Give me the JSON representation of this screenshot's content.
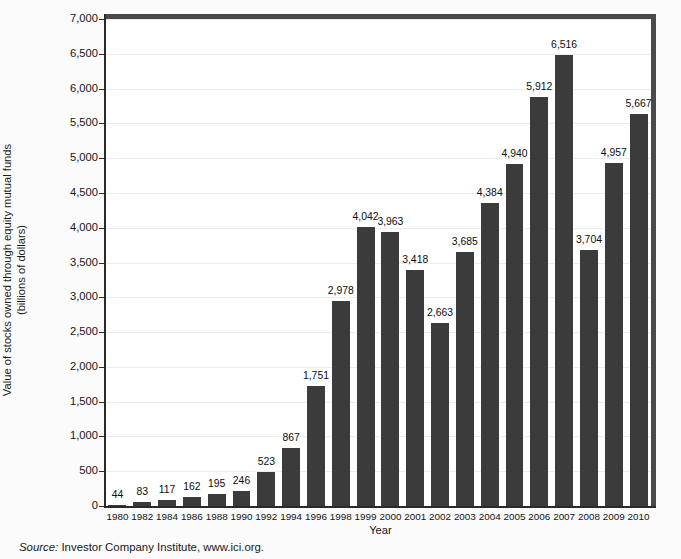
{
  "chart_data": {
    "type": "bar",
    "title": "",
    "xlabel": "Year",
    "ylabel": "Value of stocks owned through equity mutual funds",
    "ylabel_line2": "(billions of dollars)",
    "ylim": [
      0,
      7000
    ],
    "ytick_step": 500,
    "ytick_labels": [
      "7,000",
      "6,500",
      "6,000",
      "5,500",
      "5,000",
      "4,500",
      "4,000",
      "3,500",
      "3,000",
      "2,500",
      "2,000",
      "1,500",
      "1,000",
      "500",
      "0"
    ],
    "ytick_values": [
      7000,
      6500,
      6000,
      5500,
      5000,
      4500,
      4000,
      3500,
      3000,
      2500,
      2000,
      1500,
      1000,
      500,
      0
    ],
    "grid": true,
    "legend": "none",
    "bar_color": "#3b3b3b",
    "categories": [
      "1980",
      "1982",
      "1984",
      "1986",
      "1988",
      "1990",
      "1992",
      "1994",
      "1996",
      "1998",
      "1999",
      "2000",
      "2001",
      "2002",
      "2003",
      "2004",
      "2005",
      "2006",
      "2007",
      "2008",
      "2009",
      "2010"
    ],
    "values": [
      44,
      83,
      117,
      162,
      195,
      246,
      523,
      867,
      1751,
      2978,
      4042,
      3963,
      3418,
      2663,
      3685,
      4384,
      4940,
      5912,
      6516,
      3704,
      4957,
      5667
    ],
    "value_labels": [
      "44",
      "83",
      "117",
      "162",
      "195",
      "246",
      "523",
      "867",
      "1,751",
      "2,978",
      "4,042",
      "3,963",
      "3,418",
      "2,663",
      "3,685",
      "4,384",
      "4,940",
      "5,912",
      "6,516",
      "3,704",
      "4,957",
      "5,667"
    ]
  },
  "source": {
    "keyword": "Source:",
    "text": " Investor Company Institute, www.ici.org."
  }
}
